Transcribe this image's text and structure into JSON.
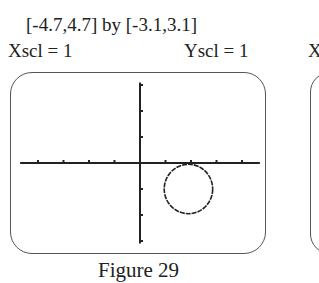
{
  "chart_data": {
    "type": "scatter",
    "title": "Figure 29",
    "window": "[-4.7,4.7] by [-3.1,3.1]",
    "xlim": [
      -4.7,
      4.7
    ],
    "ylim": [
      -3.1,
      3.1
    ],
    "xscl": 1,
    "yscl": 1,
    "grid": false,
    "xlabel": "",
    "ylabel": "",
    "curves": [
      {
        "name": "circle",
        "center": [
          1.9,
          -1.0
        ],
        "radius": 0.95
      }
    ]
  },
  "labels": {
    "window": "[-4.7,4.7] by [-3.1,3.1]",
    "xscl": "Xscl = 1",
    "yscl": "Yscl = 1",
    "next_fig_partial": "X",
    "caption": "Figure 29"
  }
}
